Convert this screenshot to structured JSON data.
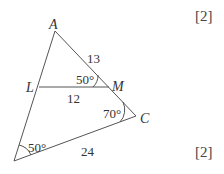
{
  "diagram": {
    "type": "triangle",
    "vertices": {
      "A": {
        "label": "A"
      },
      "B": {
        "label": ""
      },
      "C": {
        "label": "C"
      },
      "L": {
        "label": "L"
      },
      "M": {
        "label": "M"
      }
    },
    "segments": {
      "AM": {
        "length_label": "13"
      },
      "LM": {
        "length_label": "12"
      },
      "BC": {
        "length_label": "24"
      }
    },
    "angles": {
      "AML": {
        "label": "50°"
      },
      "MCB": {
        "label": "70°"
      },
      "LBC": {
        "label": "50°"
      }
    }
  },
  "marks": [
    {
      "label": "[2]"
    },
    {
      "label": "[2]"
    }
  ]
}
